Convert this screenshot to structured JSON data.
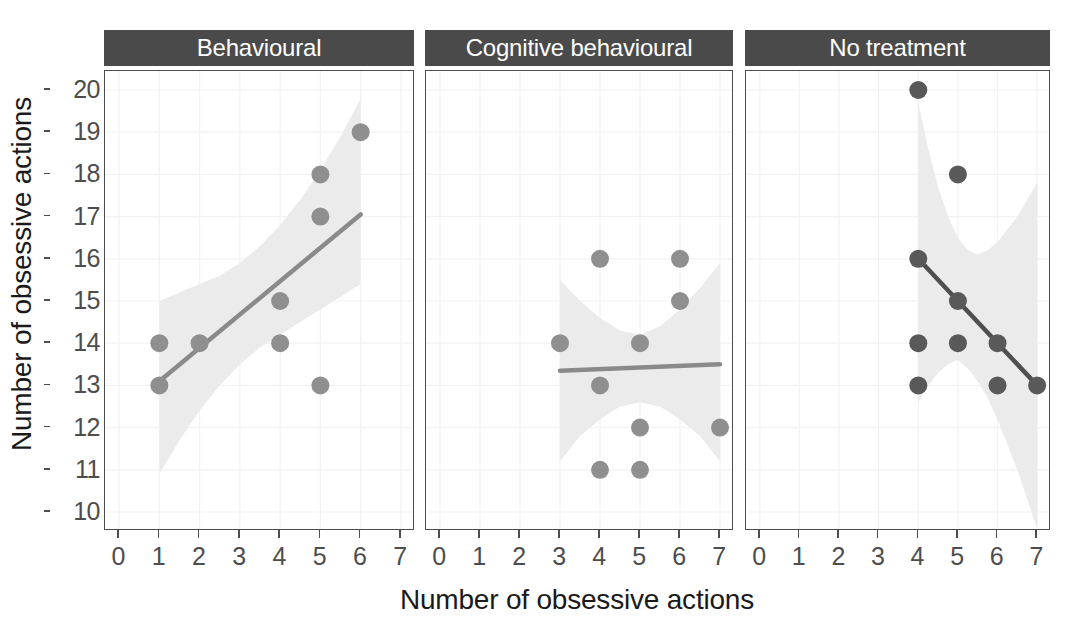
{
  "figure": {
    "xlabel": "Number of obsessive actions",
    "ylabel": "Number of obsessive actions"
  },
  "chart_data": {
    "type": "scatter",
    "title": "",
    "xlabel": "Number of obsessive actions",
    "ylabel": "Number of obsessive actions",
    "xlim": [
      -0.35,
      7.35
    ],
    "ylim": [
      9.55,
      20.45
    ],
    "xticks": [
      0,
      1,
      2,
      3,
      4,
      5,
      6,
      7
    ],
    "yticks": [
      10,
      11,
      12,
      13,
      14,
      15,
      16,
      17,
      18,
      19,
      20
    ],
    "grid": true,
    "legend": "none",
    "facet_layout": "1x3",
    "point_color": "#8c8c8c",
    "point_color_dark": "#595959",
    "line_color": "#8c8c8c",
    "line_color_dark": "#595959",
    "band_color": "#ebebeb",
    "strip_color": "#4a4a4a",
    "panels": [
      {
        "label": "Behavioural",
        "point_color": "#8f8f8f",
        "line_color": "#8a8a8a",
        "points": [
          {
            "x": 1,
            "y": 14
          },
          {
            "x": 1,
            "y": 13
          },
          {
            "x": 2,
            "y": 14
          },
          {
            "x": 4,
            "y": 15
          },
          {
            "x": 4,
            "y": 14
          },
          {
            "x": 5,
            "y": 18
          },
          {
            "x": 5,
            "y": 17
          },
          {
            "x": 5,
            "y": 13
          },
          {
            "x": 6,
            "y": 19
          }
        ],
        "fit_line": {
          "x": [
            1,
            6
          ],
          "y": [
            13.1,
            17.05
          ]
        },
        "ci_band": {
          "x": [
            1,
            1.5,
            2,
            2.5,
            3,
            3.5,
            4,
            4.5,
            5,
            5.5,
            6
          ],
          "upper": [
            15.0,
            15.2,
            15.4,
            15.6,
            15.9,
            16.3,
            16.8,
            17.4,
            18.1,
            18.9,
            19.8
          ],
          "lower": [
            10.9,
            11.7,
            12.4,
            13.0,
            13.5,
            13.9,
            14.2,
            14.5,
            14.8,
            15.1,
            15.4
          ]
        }
      },
      {
        "label": "Cognitive behavioural",
        "point_color": "#8f8f8f",
        "line_color": "#8a8a8a",
        "points": [
          {
            "x": 3,
            "y": 14
          },
          {
            "x": 4,
            "y": 16
          },
          {
            "x": 4,
            "y": 13
          },
          {
            "x": 4,
            "y": 11
          },
          {
            "x": 5,
            "y": 14
          },
          {
            "x": 5,
            "y": 12
          },
          {
            "x": 5,
            "y": 11
          },
          {
            "x": 6,
            "y": 16
          },
          {
            "x": 6,
            "y": 15
          },
          {
            "x": 7,
            "y": 12
          }
        ],
        "fit_line": {
          "x": [
            3,
            7
          ],
          "y": [
            13.35,
            13.5
          ]
        },
        "ci_band": {
          "x": [
            3,
            3.5,
            4,
            4.5,
            5,
            5.5,
            6,
            6.5,
            7
          ],
          "upper": [
            15.5,
            15.0,
            14.6,
            14.3,
            14.2,
            14.4,
            14.8,
            15.3,
            15.9
          ],
          "lower": [
            11.2,
            11.8,
            12.2,
            12.5,
            12.6,
            12.5,
            12.2,
            11.8,
            11.2
          ]
        }
      },
      {
        "label": "No treatment",
        "point_color": "#595959",
        "line_color": "#4f4f4f",
        "points": [
          {
            "x": 4,
            "y": 20
          },
          {
            "x": 5,
            "y": 18
          },
          {
            "x": 4,
            "y": 16
          },
          {
            "x": 5,
            "y": 15
          },
          {
            "x": 4,
            "y": 14
          },
          {
            "x": 5,
            "y": 14
          },
          {
            "x": 6,
            "y": 14
          },
          {
            "x": 4,
            "y": 13
          },
          {
            "x": 6,
            "y": 13
          },
          {
            "x": 7,
            "y": 13
          }
        ],
        "fit_line": {
          "x": [
            4,
            7
          ],
          "y": [
            16.0,
            13.0
          ]
        },
        "ci_band": {
          "x": [
            4,
            4.25,
            4.5,
            4.75,
            5,
            5.25,
            5.5,
            5.75,
            6,
            6.25,
            6.5,
            6.75,
            7
          ],
          "upper": [
            19.7,
            18.6,
            17.7,
            17.0,
            16.5,
            16.2,
            16.1,
            16.2,
            16.4,
            16.7,
            17.0,
            17.4,
            17.8
          ],
          "lower": [
            12.6,
            13.0,
            13.3,
            13.5,
            13.6,
            13.4,
            13.1,
            12.7,
            12.2,
            11.6,
            11.0,
            10.3,
            9.6
          ]
        }
      }
    ]
  },
  "panel_geometry": {
    "panels": [
      {
        "left": 104,
        "width": 310
      },
      {
        "left": 425,
        "width": 308
      },
      {
        "left": 745,
        "width": 305
      }
    ],
    "plot_top": 70,
    "plot_height": 460
  }
}
